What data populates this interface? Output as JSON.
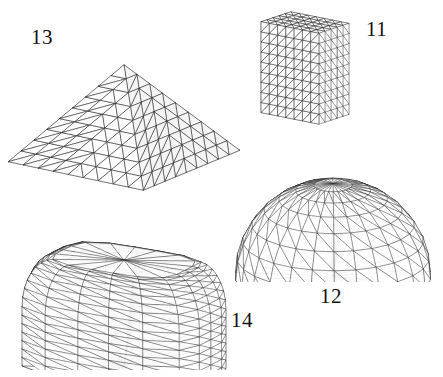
{
  "figure": {
    "background_color": "#ffffff",
    "line_color": "#111111",
    "width": 443,
    "height": 377
  },
  "labels": [
    {
      "id": "13",
      "text": "13",
      "x": 31,
      "y": 27
    },
    {
      "id": "11",
      "text": "11",
      "x": 366,
      "y": 19
    },
    {
      "id": "12",
      "text": "12",
      "x": 320,
      "y": 286
    },
    {
      "id": "14",
      "text": "14",
      "x": 231,
      "y": 310
    }
  ],
  "shapes": [
    {
      "id": "shape-13",
      "label": "13",
      "kind": "pyramid-mesh",
      "x": 4,
      "y": 6,
      "width": 240,
      "height": 200
    },
    {
      "id": "shape-11",
      "label": "11",
      "kind": "box-mesh",
      "x": 248,
      "y": 4,
      "width": 114,
      "height": 128
    },
    {
      "id": "shape-12",
      "label": "12",
      "kind": "hemisphere-mesh",
      "x": 230,
      "y": 136,
      "width": 206,
      "height": 146
    },
    {
      "id": "shape-14",
      "label": "14",
      "kind": "rounded-block-mesh",
      "x": 12,
      "y": 216,
      "width": 226,
      "height": 154
    }
  ],
  "chart_data": {
    "type": "table",
    "title": "",
    "categories": [
      "11",
      "12",
      "13",
      "14"
    ],
    "values": [
      1,
      1,
      1,
      1
    ],
    "annotations": [
      {
        "label": "11",
        "geometry": "rectangular box (brick) tetrahedral mesh"
      },
      {
        "label": "12",
        "geometry": "hemisphere / dome tetrahedral mesh"
      },
      {
        "label": "13",
        "geometry": "square pyramid tetrahedral mesh"
      },
      {
        "label": "14",
        "geometry": "block with rounded (filleted) top tetrahedral mesh"
      }
    ]
  }
}
